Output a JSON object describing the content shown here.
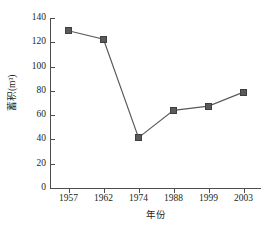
{
  "chart_data": {
    "type": "line",
    "title": "",
    "xlabel": "年份",
    "ylabel": "蓄积(m³)",
    "categories": [
      "1957",
      "1962",
      "1974",
      "1988",
      "1999",
      "2003"
    ],
    "x": [
      1957,
      1962,
      1974,
      1988,
      1999,
      2003
    ],
    "values": [
      129.5,
      122.5,
      41.5,
      64,
      67.5,
      79
    ],
    "series": [
      {
        "name": "蓄积(m³)",
        "values": [
          129.5,
          122.5,
          41.5,
          64,
          67.5,
          79
        ],
        "marker": "square",
        "color": "#5a5a5a"
      }
    ],
    "ylim": [
      0,
      140
    ],
    "yticks": [
      0,
      20,
      40,
      60,
      80,
      100,
      120,
      140
    ],
    "ytick_labels": [
      "0",
      "20",
      "40",
      "60",
      "80",
      "100",
      "120",
      "140"
    ],
    "xtick_labels": [
      "1957",
      "1962",
      "1974",
      "1988",
      "1999",
      "2003"
    ],
    "grid": false,
    "legend": "none",
    "spines": [
      "left",
      "bottom"
    ],
    "tick_direction": "in",
    "line_color": "#5a5a5a",
    "axis_color": "#4d4d4d",
    "text_color": "#231f20",
    "background": "#ffffff"
  }
}
